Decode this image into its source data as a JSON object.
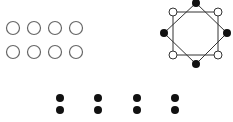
{
  "figure": {
    "open_circle_grid": {
      "rows": 2,
      "cols": 4,
      "count": 8,
      "fill": "none",
      "stroke": "#555555"
    },
    "octagon_figure": {
      "filled_vertices": 4,
      "open_vertices": 4,
      "shapes": [
        "square",
        "diamond"
      ]
    },
    "dot_pairs": {
      "count": 4,
      "dots_per_pair": 2,
      "fill": "#111111"
    }
  }
}
